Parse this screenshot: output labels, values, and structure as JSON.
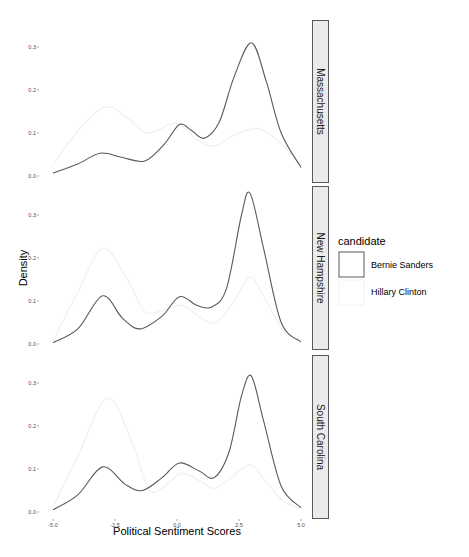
{
  "chart_data": {
    "type": "line",
    "subtype": "density (faceted)",
    "title": "",
    "xlabel": "Political Sentiment Scores",
    "ylabel": "Density",
    "xlim": [
      -5.0,
      5.0
    ],
    "ylim": [
      0.0,
      0.35
    ],
    "x_ticks": [
      "-5.0",
      "-2.5",
      "0.0",
      "2.5",
      "5.0"
    ],
    "x_tick_values": [
      -5.0,
      -2.5,
      0.0,
      2.5,
      5.0
    ],
    "y_ticks": [
      "0.0",
      "0.1",
      "0.2",
      "0.3"
    ],
    "y_tick_values": [
      0.0,
      0.1,
      0.2,
      0.3
    ],
    "grid": false,
    "legend": {
      "title": "candidate",
      "position": "right",
      "entries": [
        {
          "label": "Bernie Sanders",
          "color": "#595959"
        },
        {
          "label": "Hillary Clinton",
          "color": "#f2f2f2"
        }
      ]
    },
    "facets": [
      {
        "label": "Massachusetts",
        "series": [
          {
            "name": "Bernie Sanders",
            "x": [
              -5.0,
              -4.0,
              -3.1,
              -2.2,
              -1.3,
              -0.5,
              0.1,
              0.6,
              1.1,
              1.7,
              2.3,
              3.0,
              3.6,
              4.2,
              5.0
            ],
            "values": [
              0.007,
              0.028,
              0.053,
              0.043,
              0.035,
              0.075,
              0.12,
              0.105,
              0.088,
              0.125,
              0.23,
              0.31,
              0.22,
              0.1,
              0.02
            ]
          },
          {
            "name": "Hillary Clinton",
            "x": [
              -5.0,
              -4.0,
              -2.9,
              -2.0,
              -1.2,
              0.0,
              0.8,
              1.5,
              2.3,
              3.3,
              4.2,
              5.0
            ],
            "values": [
              0.025,
              0.105,
              0.16,
              0.135,
              0.1,
              0.123,
              0.085,
              0.07,
              0.095,
              0.11,
              0.075,
              0.025
            ]
          }
        ]
      },
      {
        "label": "New Hampshire",
        "series": [
          {
            "name": "Bernie Sanders",
            "x": [
              -5.0,
              -4.0,
              -3.0,
              -2.2,
              -1.5,
              -0.6,
              0.1,
              0.8,
              1.4,
              2.0,
              2.6,
              2.95,
              3.5,
              4.2,
              5.0
            ],
            "values": [
              0.003,
              0.035,
              0.112,
              0.06,
              0.035,
              0.065,
              0.11,
              0.09,
              0.086,
              0.13,
              0.3,
              0.35,
              0.22,
              0.05,
              0.005
            ]
          },
          {
            "name": "Hillary Clinton",
            "x": [
              -5.0,
              -4.0,
              -3.0,
              -2.0,
              -1.3,
              -0.5,
              0.2,
              1.0,
              1.6,
              2.3,
              2.95,
              3.6,
              4.3,
              5.0
            ],
            "values": [
              0.008,
              0.12,
              0.223,
              0.15,
              0.075,
              0.08,
              0.09,
              0.06,
              0.05,
              0.1,
              0.155,
              0.1,
              0.03,
              0.008
            ]
          }
        ]
      },
      {
        "label": "South Carolina",
        "series": [
          {
            "name": "Bernie Sanders",
            "x": [
              -5.0,
              -4.0,
              -3.0,
              -2.1,
              -1.4,
              -0.6,
              0.1,
              0.9,
              1.5,
              2.1,
              2.6,
              3.0,
              3.5,
              4.2,
              5.0
            ],
            "values": [
              0.005,
              0.04,
              0.105,
              0.065,
              0.05,
              0.08,
              0.114,
              0.095,
              0.08,
              0.14,
              0.27,
              0.316,
              0.21,
              0.06,
              0.01
            ]
          },
          {
            "name": "Hillary Clinton",
            "x": [
              -5.0,
              -4.0,
              -2.8,
              -1.8,
              -1.1,
              -0.3,
              0.2,
              1.0,
              1.5,
              2.2,
              2.95,
              3.6,
              4.3,
              5.0
            ],
            "values": [
              0.01,
              0.13,
              0.265,
              0.16,
              0.05,
              0.07,
              0.09,
              0.07,
              0.055,
              0.08,
              0.11,
              0.07,
              0.025,
              0.008
            ]
          }
        ]
      }
    ]
  },
  "layout": {
    "panels": [
      {
        "top": 20,
        "bottom": 183,
        "zero_y": 176
      },
      {
        "top": 186,
        "bottom": 350,
        "zero_y": 344
      },
      {
        "top": 355,
        "bottom": 519,
        "zero_y": 512
      }
    ],
    "x_zero_px": 177,
    "x_px_per_unit": 24.8,
    "y_px_per_unit": 430,
    "plot_left": 40,
    "plot_right": 311,
    "strip_left": 312,
    "strip_width": 17
  },
  "colors": {
    "bernie": "#595959",
    "hillary": "#f2f2f2",
    "strip_fill": "#ebebeb",
    "strip_border": "#595959",
    "tick": "#4d4d4d"
  }
}
